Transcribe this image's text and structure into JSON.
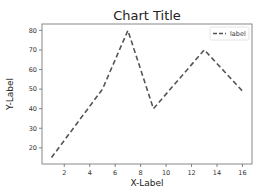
{
  "chart_data": {
    "type": "line",
    "title": "Chart Title",
    "xlabel": "X-Label",
    "ylabel": "Y-Label",
    "x": [
      1,
      5,
      7,
      9,
      13,
      16
    ],
    "series": [
      {
        "name": "label",
        "values": [
          15,
          50,
          80,
          40,
          70,
          49
        ],
        "style": "dashed",
        "color": "#555555"
      }
    ],
    "xticks": [
      2,
      4,
      6,
      8,
      10,
      12,
      14,
      16
    ],
    "yticks": [
      20,
      30,
      40,
      50,
      60,
      70,
      80
    ],
    "xlim": [
      0.25,
      16.75
    ],
    "ylim": [
      11.75,
      83.25
    ],
    "grid": false,
    "legend_position": "upper right"
  }
}
